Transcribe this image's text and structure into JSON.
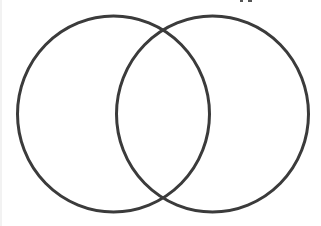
{
  "diagram": {
    "type": "venn",
    "set_count": 2,
    "stroke_color": "#3a3a3a",
    "background_color": "#ffffff",
    "sets": [
      {
        "id": "left",
        "label": "",
        "cx": 113.5,
        "cy": 114,
        "rx": 96,
        "ry": 98
      },
      {
        "id": "right",
        "label": "",
        "cx": 212.5,
        "cy": 114,
        "rx": 96,
        "ry": 98
      }
    ],
    "labels_visible": false
  }
}
